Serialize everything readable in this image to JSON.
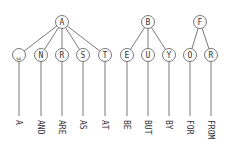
{
  "diagram": {
    "type": "trie",
    "colors": {
      "stroke": "#555555",
      "fill": "#ffffff",
      "text": "#333333"
    },
    "node_radius": 6.5,
    "parent_y": 22,
    "child_y": 55,
    "line_end_y": 116,
    "label_y": 120,
    "trees": [
      {
        "root": "A",
        "x": 62,
        "children": [
          {
            "label": "␣",
            "x": 19,
            "word": "A"
          },
          {
            "label": "N",
            "x": 41,
            "word": "AND"
          },
          {
            "label": "R",
            "x": 62,
            "word": "ARE"
          },
          {
            "label": "S",
            "x": 83,
            "word": "AS"
          },
          {
            "label": "T",
            "x": 105,
            "word": "AT"
          }
        ]
      },
      {
        "root": "B",
        "x": 148,
        "children": [
          {
            "label": "E",
            "x": 127,
            "word": "BE"
          },
          {
            "label": "U",
            "x": 148,
            "word": "BUT"
          },
          {
            "label": "Y",
            "x": 169,
            "word": "BY"
          }
        ]
      },
      {
        "root": "F",
        "x": 200,
        "children": [
          {
            "label": "O",
            "x": 190,
            "word": "FOR"
          },
          {
            "label": "R",
            "x": 211,
            "word": "FROM"
          }
        ]
      }
    ]
  }
}
